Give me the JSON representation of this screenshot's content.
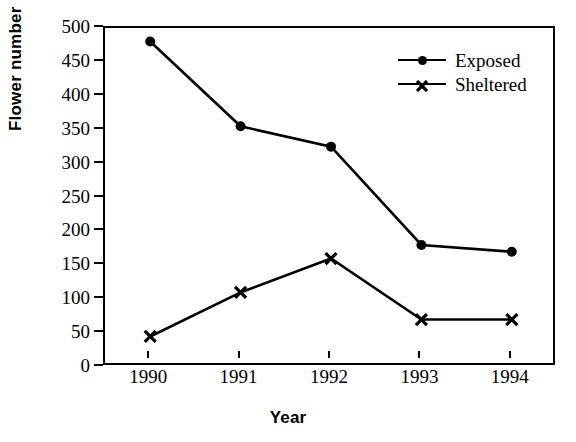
{
  "chart_data": {
    "type": "line",
    "title": "",
    "xlabel": "Year",
    "ylabel": "Flower number",
    "categories": [
      "1990",
      "1991",
      "1992",
      "1993",
      "1994"
    ],
    "x": [
      1990,
      1991,
      1992,
      1993,
      1994
    ],
    "series": [
      {
        "name": "Exposed",
        "marker": "filled-circle",
        "color": "#000000",
        "values": [
          480,
          355,
          325,
          180,
          170
        ]
      },
      {
        "name": "Sheltered",
        "marker": "x-cross",
        "color": "#000000",
        "values": [
          45,
          110,
          160,
          70,
          70
        ]
      }
    ],
    "ylim": [
      0,
      500
    ],
    "ytick_step": 50,
    "yticks": [
      0,
      50,
      100,
      150,
      200,
      250,
      300,
      350,
      400,
      450,
      500
    ],
    "ytick_labels": [
      "0",
      "50",
      "100",
      "150",
      "200",
      "250",
      "300",
      "350",
      "400",
      "450",
      "500"
    ],
    "xtick_labels": [
      "1990",
      "1991",
      "1992",
      "1993",
      "1994"
    ],
    "grid": false,
    "legend_position": "top-right",
    "legend_entries": [
      "Exposed",
      "Sheltered"
    ],
    "frame": "box"
  },
  "axes": {
    "y_title": "Flower number",
    "x_title": "Year"
  },
  "legend": {
    "items": [
      {
        "label": "Exposed",
        "marker": "filled-circle-marker-icon"
      },
      {
        "label": "Sheltered",
        "marker": "x-cross-marker-icon"
      }
    ]
  },
  "colors": {
    "ink": "#000000",
    "background": "#ffffff"
  }
}
